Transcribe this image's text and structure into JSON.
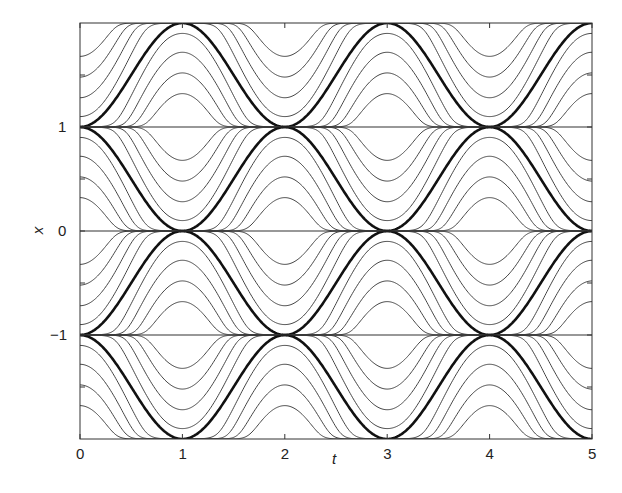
{
  "chart_data": {
    "type": "line",
    "title": "",
    "xlabel": "t",
    "ylabel": "x",
    "xlim": [
      0,
      5
    ],
    "ylim": [
      -2,
      2
    ],
    "grid": false,
    "legend": null,
    "xticks": [
      0,
      1,
      2,
      3,
      4,
      5
    ],
    "xtick_labels": [
      "0",
      "1",
      "2",
      "3",
      "4",
      "5"
    ],
    "yticks": [
      -1,
      0,
      1
    ],
    "ytick_labels": [
      "−1",
      "0",
      "1"
    ],
    "equilibrium_lines": [
      -1,
      0,
      1
    ],
    "separatrices": [
      {
        "band": [
          1,
          2
        ],
        "touches_top_at_t": [
          1,
          3,
          5
        ],
        "touches_bottom_at_t": [
          0,
          2,
          4
        ]
      },
      {
        "band": [
          0,
          1
        ],
        "touches_top_at_t": [
          0,
          2,
          4
        ],
        "touches_bottom_at_t": [
          1,
          3,
          5
        ]
      },
      {
        "band": [
          -1,
          0
        ],
        "touches_top_at_t": [
          1,
          3,
          5
        ],
        "touches_bottom_at_t": [
          0,
          2,
          4
        ]
      },
      {
        "band": [
          -2,
          -1
        ],
        "touches_top_at_t": [
          0,
          2,
          4
        ],
        "touches_bottom_at_t": [
          1,
          3,
          5
        ]
      }
    ],
    "thin_curve_offsets": [
      -0.8,
      -0.6,
      -0.4,
      -0.2,
      0.2,
      0.4,
      0.6,
      0.8
    ]
  }
}
